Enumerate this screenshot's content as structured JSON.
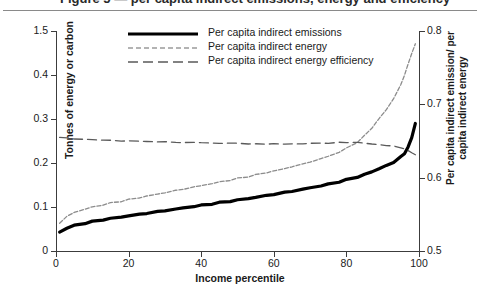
{
  "header": {
    "cut_title": "Figure 5 — per capita indirect emissions, energy and efficiency",
    "rule_color": "#8a8a8a"
  },
  "legend": {
    "entries": [
      {
        "label": "Per capita indirect emissions",
        "style": "solid-thick",
        "color": "#000000"
      },
      {
        "label": "Per capita indirect energy",
        "style": "dashed-thin-light",
        "color": "#8c8c8c"
      },
      {
        "label": "Per capita indirect energy efficiency",
        "style": "dashed-long",
        "color": "#5a5a5a"
      }
    ]
  },
  "axes": {
    "left_title": "Tonnes of energy or carbon",
    "right_title": "Per capita indirect emission/ per capita indirect energy",
    "x_title": "Income percentile",
    "left_ticks": [
      "0",
      "0.1",
      "0.2",
      "0.3",
      "0.4",
      "1.5"
    ],
    "right_ticks": [
      "0.5",
      "0.6",
      "0.7",
      "0.8"
    ],
    "x_ticks": [
      "0",
      "20",
      "40",
      "60",
      "80",
      "100"
    ]
  },
  "chart_data": {
    "type": "line",
    "title": "",
    "xlabel": "Income percentile",
    "ylabel": "Tonnes of energy or carbon",
    "ylabel_secondary": "Per capita indirect emission/ per capita indirect energy",
    "xlim": [
      0,
      100
    ],
    "ylim": [
      0,
      0.5
    ],
    "ylim_secondary": [
      0.5,
      0.8
    ],
    "grid": false,
    "legend_position": "top-center",
    "x": [
      1,
      3,
      5,
      8,
      10,
      13,
      15,
      18,
      20,
      23,
      25,
      28,
      30,
      33,
      35,
      38,
      40,
      43,
      45,
      48,
      50,
      53,
      55,
      58,
      60,
      63,
      65,
      68,
      70,
      73,
      75,
      78,
      80,
      83,
      85,
      87,
      89,
      91,
      93,
      95,
      96,
      97,
      98,
      99
    ],
    "series": [
      {
        "name": "Per capita indirect emissions",
        "axis": "left",
        "style": "solid-thick",
        "color": "#000000",
        "values": [
          0.043,
          0.052,
          0.058,
          0.063,
          0.067,
          0.071,
          0.074,
          0.077,
          0.08,
          0.083,
          0.086,
          0.089,
          0.092,
          0.095,
          0.098,
          0.101,
          0.104,
          0.107,
          0.11,
          0.113,
          0.116,
          0.119,
          0.122,
          0.126,
          0.129,
          0.133,
          0.136,
          0.14,
          0.144,
          0.148,
          0.152,
          0.157,
          0.162,
          0.168,
          0.174,
          0.18,
          0.187,
          0.194,
          0.202,
          0.214,
          0.222,
          0.236,
          0.258,
          0.29
        ]
      },
      {
        "name": "Per capita indirect energy",
        "axis": "left",
        "style": "dashed-thin-light",
        "color": "#8c8c8c",
        "values": [
          0.064,
          0.078,
          0.088,
          0.095,
          0.1,
          0.105,
          0.109,
          0.113,
          0.117,
          0.121,
          0.125,
          0.129,
          0.133,
          0.137,
          0.141,
          0.145,
          0.149,
          0.153,
          0.157,
          0.161,
          0.165,
          0.169,
          0.173,
          0.178,
          0.182,
          0.187,
          0.192,
          0.197,
          0.203,
          0.209,
          0.216,
          0.224,
          0.234,
          0.247,
          0.262,
          0.28,
          0.3,
          0.322,
          0.346,
          0.378,
          0.4,
          0.424,
          0.45,
          0.47
        ]
      },
      {
        "name": "Per capita indirect energy efficiency",
        "axis": "right",
        "style": "dashed-long",
        "color": "#5a5a5a",
        "values": [
          0.655,
          0.654,
          0.653,
          0.652,
          0.652,
          0.651,
          0.651,
          0.65,
          0.65,
          0.65,
          0.649,
          0.649,
          0.649,
          0.648,
          0.648,
          0.648,
          0.648,
          0.647,
          0.647,
          0.647,
          0.647,
          0.646,
          0.646,
          0.646,
          0.646,
          0.646,
          0.646,
          0.646,
          0.647,
          0.647,
          0.647,
          0.648,
          0.648,
          0.648,
          0.647,
          0.646,
          0.645,
          0.644,
          0.643,
          0.641,
          0.639,
          0.637,
          0.634,
          0.631
        ]
      }
    ]
  }
}
